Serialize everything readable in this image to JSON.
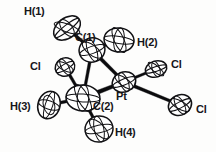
{
  "figure": {
    "kind": "ortep-thermal-ellipsoid-plot",
    "title": "",
    "caption": "",
    "background_color": "#fdfdfc",
    "line_color": "#0b0b0d",
    "shell_fill": "#ffffff",
    "label_color": "#16161a"
  },
  "molecule": {
    "name": "platinum dichloride metallacycle",
    "central_atom": "Pt",
    "labels": {
      "h1": "H(1)",
      "c1": "C(1)",
      "h2": "H(2)",
      "cl_left": "Cl",
      "cl_upper_right": "Cl",
      "cl_lower_right": "Cl",
      "h3": "H(3)",
      "c2": "C(2)",
      "pt": "Pt",
      "h4": "H(4)"
    },
    "atoms": [
      {
        "id": "h1",
        "element": "H",
        "label": "H(1)",
        "cx": 67,
        "cy": 28,
        "rx": 15,
        "ry": 10,
        "rot": -38,
        "label_x": 24,
        "label_y": 15,
        "label_anchor": "start"
      },
      {
        "id": "c1",
        "element": "C",
        "label": "C(1)",
        "cx": 92,
        "cy": 50,
        "rx": 13,
        "ry": 12,
        "rot": -20,
        "label_x": 75,
        "label_y": 41,
        "label_anchor": "start"
      },
      {
        "id": "h2",
        "element": "H",
        "label": "H(2)",
        "cx": 119,
        "cy": 40,
        "rx": 15,
        "ry": 12,
        "rot": 8,
        "label_x": 137,
        "label_y": 46,
        "label_anchor": "start"
      },
      {
        "id": "cll",
        "element": "Cl",
        "label": "Cl",
        "cx": 65,
        "cy": 67,
        "rx": 10,
        "ry": 9,
        "rot": -30,
        "label_x": 30,
        "label_y": 70,
        "label_anchor": "start"
      },
      {
        "id": "c2",
        "element": "C",
        "label": "C(2)",
        "cx": 83,
        "cy": 98,
        "rx": 17,
        "ry": 13,
        "rot": 4,
        "label_x": 93,
        "label_y": 110,
        "label_anchor": "start"
      },
      {
        "id": "h3",
        "element": "H",
        "label": "H(3)",
        "cx": 49,
        "cy": 105,
        "rx": 11,
        "ry": 14,
        "rot": 18,
        "label_x": 10,
        "label_y": 110,
        "label_anchor": "start"
      },
      {
        "id": "h4",
        "element": "H",
        "label": "H(4)",
        "cx": 99,
        "cy": 129,
        "rx": 14,
        "ry": 13,
        "rot": -12,
        "label_x": 115,
        "label_y": 136,
        "label_anchor": "start"
      },
      {
        "id": "pt",
        "element": "Pt",
        "label": "Pt",
        "cx": 124,
        "cy": 82,
        "rx": 12,
        "ry": 10,
        "rot": -22,
        "label_x": 116,
        "label_y": 100,
        "label_anchor": "start"
      },
      {
        "id": "clu",
        "element": "Cl",
        "label": "Cl",
        "cx": 156,
        "cy": 69,
        "rx": 11,
        "ry": 8,
        "rot": -18,
        "label_x": 171,
        "label_y": 68,
        "label_anchor": "start"
      },
      {
        "id": "clr",
        "element": "Cl",
        "label": "Cl",
        "cx": 180,
        "cy": 105,
        "rx": 12,
        "ry": 10,
        "rot": -28,
        "label_x": 196,
        "label_y": 113,
        "label_anchor": "start"
      }
    ],
    "bonds": [
      {
        "from": "h1",
        "to": "c1",
        "width": 3.0
      },
      {
        "from": "h2",
        "to": "c1",
        "width": 3.0
      },
      {
        "from": "c1",
        "to": "c2",
        "width": 3.0
      },
      {
        "from": "c1",
        "to": "pt",
        "width": 3.6
      },
      {
        "from": "c2",
        "to": "pt",
        "width": 4.2
      },
      {
        "from": "cll",
        "to": "c2",
        "width": 3.0
      },
      {
        "from": "h3",
        "to": "c2",
        "width": 3.0
      },
      {
        "from": "h4",
        "to": "c2",
        "width": 3.0
      },
      {
        "from": "pt",
        "to": "clu",
        "width": 2.6
      },
      {
        "from": "pt",
        "to": "clr",
        "width": 3.2
      }
    ]
  }
}
